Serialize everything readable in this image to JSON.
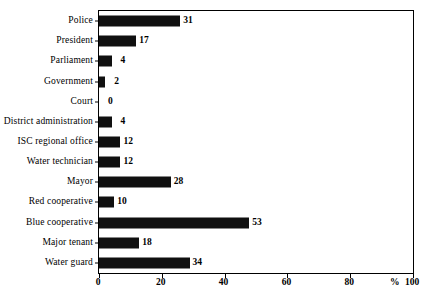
{
  "chart_data": {
    "type": "bar",
    "orientation": "horizontal",
    "title": "",
    "subtitle": "",
    "xlabel": "%",
    "ylabel": "",
    "xlim": [
      0,
      100
    ],
    "ylim": null,
    "grid": false,
    "legend": null,
    "xticks": [
      "0",
      "20",
      "40",
      "60",
      "80",
      "100"
    ],
    "xtick_values": [
      0,
      20,
      40,
      60,
      80,
      100
    ],
    "categories": [
      "Police",
      "President",
      "Parliament",
      "Government",
      "Court",
      "District administration",
      "ISC regional office",
      "Water technician",
      "Mayor",
      "Red cooperative",
      "Blue cooperative",
      "Major tenant",
      "Water guard"
    ],
    "values": [
      31,
      17,
      4,
      2,
      0,
      4,
      12,
      12,
      28,
      10,
      53,
      18,
      34
    ],
    "value_labels": [
      "31",
      "17",
      "4",
      "2",
      "0",
      "4",
      "12",
      "12",
      "28",
      "10",
      "53",
      "18",
      "34"
    ],
    "bar_color": "#101010",
    "axis_color": "#000000",
    "background_color": "#ffffff"
  },
  "axis": {
    "percent_symbol": "%",
    "last_tick": "100"
  },
  "caption": {
    "text": ""
  }
}
